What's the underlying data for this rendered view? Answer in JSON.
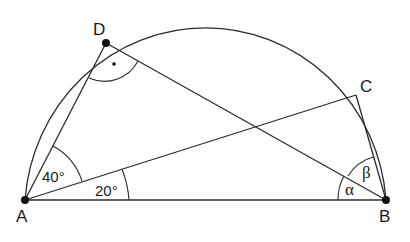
{
  "diagram": {
    "type": "geometry",
    "points": {
      "A": {
        "label": "A",
        "x": 25,
        "y": 200
      },
      "B": {
        "label": "B",
        "x": 386,
        "y": 200
      },
      "C": {
        "label": "C",
        "x": 356,
        "y": 95
      },
      "D": {
        "label": "D",
        "x": 106,
        "y": 43
      }
    },
    "segments": [
      "AB",
      "AD",
      "AC",
      "BD",
      "BC"
    ],
    "arc": "semicircle over AB",
    "angles": {
      "DAC": "40°",
      "CAB": "20°",
      "ABD": "α",
      "DBC": "β",
      "ADB": "right angle (marked with dot)"
    }
  },
  "labels": {
    "A": "A",
    "B": "B",
    "C": "C",
    "D": "D",
    "angle_DAC": "40°",
    "angle_CAB": "20°",
    "alpha": "α",
    "beta": "β"
  }
}
